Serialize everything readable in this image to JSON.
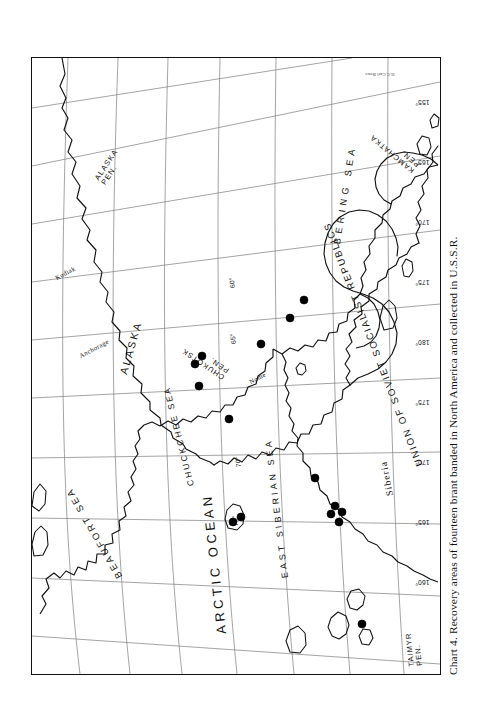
{
  "figure": {
    "caption": "Chart 4. Recovery areas of fourteen brant banded in North America and collected in U.S.S.R.",
    "credit": "H.C.Carl Bowe"
  },
  "map": {
    "projection_note": "polar stereographic, Bering Strait region",
    "ocean_labels": [
      {
        "id": "arctic_ocean",
        "text": "ARCTIC  OCEAN"
      }
    ],
    "sea_labels": [
      {
        "id": "beaufort_sea",
        "text": "BEAUFORT  SEA"
      },
      {
        "id": "chuckchee_sea",
        "text": "CHUCKCHEE SEA"
      },
      {
        "id": "east_siberian_sea",
        "text": "EAST SIBERIAN SEA"
      },
      {
        "id": "bering_sea",
        "text": "BERING   SEA"
      }
    ],
    "country_labels": [
      {
        "id": "alaska",
        "text": "ALASKA"
      },
      {
        "id": "ussr",
        "text": "UNION OF SOVIET SOCIALIST REPUBLICS"
      },
      {
        "id": "siberia",
        "text": "Siberia"
      }
    ],
    "peninsula_labels": [
      {
        "id": "taimyr_pen",
        "line1": "TAIMYR",
        "line2": "PEN."
      },
      {
        "id": "chukotsk_pen",
        "line1": "CHUKOTSK",
        "line2": "PEN."
      },
      {
        "id": "alaska_pen",
        "line1": "ALASKA",
        "line2": "PEN."
      },
      {
        "id": "kamchatka_pen",
        "line1": "KAMCHATKA",
        "line2": "PEN."
      }
    ],
    "city_labels": [
      {
        "id": "anchorage",
        "text": "Anchorage"
      },
      {
        "id": "nome",
        "text": "Nome"
      },
      {
        "id": "kodiak",
        "text": "Kodiak"
      }
    ],
    "latitude_ticks": [
      {
        "value": "75°"
      },
      {
        "value": "70°"
      },
      {
        "value": "65°"
      },
      {
        "value": "60°"
      }
    ],
    "longitude_ticks": [
      {
        "value": "155°"
      },
      {
        "value": "165°"
      },
      {
        "value": "170°"
      },
      {
        "value": "175°"
      },
      {
        "value": "180°"
      },
      {
        "value": "175°"
      },
      {
        "value": "170°"
      },
      {
        "value": "165°"
      },
      {
        "value": "160°"
      }
    ],
    "recovery_points": {
      "count": 14,
      "symbol": "filled-circle",
      "color": "#000000",
      "clusters": [
        {
          "id": "taimyr",
          "n": 1
        },
        {
          "id": "kolyma-delta",
          "n": 4
        },
        {
          "id": "east-siberian-coast",
          "n": 1
        },
        {
          "id": "wrangel-island",
          "n": 2
        },
        {
          "id": "chukchi-coast",
          "n": 2
        },
        {
          "id": "chukotsk-pen-north",
          "n": 2
        },
        {
          "id": "anadyr",
          "n": 1
        },
        {
          "id": "kamchatka-north",
          "n": 1
        }
      ]
    },
    "colors": {
      "coastline": "#111111",
      "graticule": "#7a7a7a",
      "frame": "#111111",
      "background": "#ffffff"
    }
  }
}
